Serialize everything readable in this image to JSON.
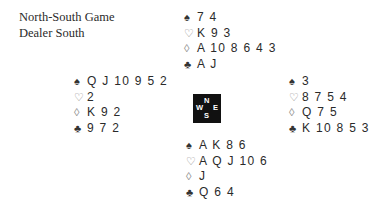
{
  "info": {
    "vulnerability": "North-South Game",
    "dealer": "Dealer South"
  },
  "suits": {
    "spades": "♠",
    "hearts": "♡",
    "diamonds": "◊",
    "clubs": "♣"
  },
  "hands": {
    "north": {
      "spades": "7 4",
      "hearts": "K 9 3",
      "diamonds": "A 10 8 6 4 3",
      "clubs": "A J"
    },
    "west": {
      "spades": "Q J 10 9 5 2",
      "hearts": "2",
      "diamonds": "K 9 2",
      "clubs": "9 7 2"
    },
    "east": {
      "spades": "3",
      "hearts": "8 7 5 4",
      "diamonds": "Q 7 5",
      "clubs": "K 10 8 5 3"
    },
    "south": {
      "spades": "A K 8 6",
      "hearts": "A Q J 10 6",
      "diamonds": "J",
      "clubs": "Q 6 4"
    }
  },
  "compass": {
    "north": "N",
    "south": "S",
    "west": "W",
    "east": "E",
    "background": "#111111",
    "text_color": "#ffffff"
  }
}
